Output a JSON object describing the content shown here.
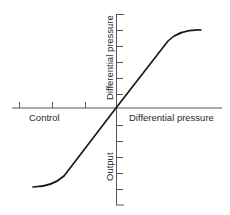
{
  "diagram": {
    "type": "transfer-characteristic",
    "axes": {
      "horizontal": {
        "left_label": "Control",
        "right_label": "Differential pressure",
        "tick_count_left": 3
      },
      "vertical": {
        "upper_label": "Differential pressure",
        "lower_label": "Output",
        "tick_count_upper": 5,
        "tick_count_lower": 5
      }
    },
    "curve": {
      "shape": "S-curve (saturating at both ends) passing through origin",
      "color": "#1a1a1a"
    },
    "colors": {
      "line": "#1a1a1a",
      "axis": "#555555",
      "text": "#2a2a2a",
      "background": "#ffffff"
    }
  }
}
